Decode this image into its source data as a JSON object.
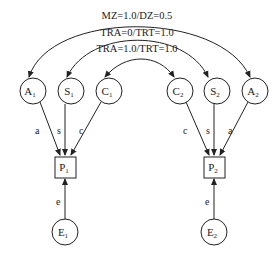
{
  "diagram": {
    "type": "twin-ace-model",
    "arc_labels": {
      "outer": "MZ=1.0/DZ=0.5",
      "middle": "TRA=0/TRT=1.0",
      "inner": "TRA=1.0/TRT=1.0"
    },
    "latent_nodes": {
      "A1": {
        "main": "A",
        "sub": "1"
      },
      "S1": {
        "main": "S",
        "sub": "1"
      },
      "C1": {
        "main": "C",
        "sub": "1"
      },
      "C2": {
        "main": "C",
        "sub": "2"
      },
      "S2": {
        "main": "S",
        "sub": "2"
      },
      "A2": {
        "main": "A",
        "sub": "2"
      },
      "E1": {
        "main": "E",
        "sub": "1"
      },
      "E2": {
        "main": "E",
        "sub": "2"
      }
    },
    "observed_nodes": {
      "P1": {
        "main": "P",
        "sub": "1"
      },
      "P2": {
        "main": "P",
        "sub": "2"
      }
    },
    "paths": {
      "a": "a",
      "s": "s",
      "c": "c",
      "e": "e"
    },
    "colors": {
      "stroke": "#222222",
      "background": "#ffffff"
    }
  }
}
